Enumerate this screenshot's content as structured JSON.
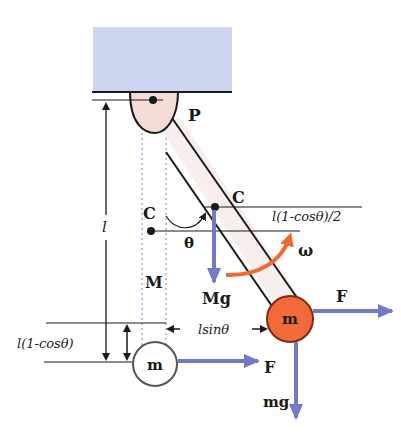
{
  "labels": {
    "pivot": "P",
    "length": "l",
    "center_upper": "C",
    "center_lower": "C",
    "theta": "θ",
    "omega": "ω",
    "rod_mass": "M",
    "rod_weight": "Mg",
    "ball_mass_displaced": "m",
    "ball_mass_rest": "m",
    "force_displaced": "F",
    "force_rest": "F",
    "ball_weight": "mg",
    "horizontal_offset": "lsinθ",
    "vertical_rise_ball": "l(1-cosθ)",
    "vertical_rise_center": "l(1-cosθ)/2"
  },
  "colors": {
    "ceiling": "#cdd6ee",
    "pivot": "#f6dcd6",
    "rod": "#f8eeee",
    "ball_displaced": "#f26a3a",
    "ball_rest": "#ffffff",
    "force_arrow": "#7478c8",
    "omega_arrow": "#f06a30",
    "line": "#1a1a1a",
    "dotted": "#8a9ad0"
  }
}
